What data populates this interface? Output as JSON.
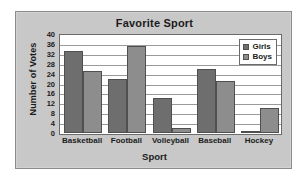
{
  "chart_data": {
    "type": "bar",
    "title": "Favorite Sport",
    "xlabel": "Sport",
    "ylabel": "Number of Votes",
    "categories": [
      "Basketball",
      "Football",
      "Volleyball",
      "Baseball",
      "Hockey"
    ],
    "series": [
      {
        "name": "Girls",
        "color": "#6e6e6e",
        "values": [
          33,
          22,
          14,
          26,
          1
        ]
      },
      {
        "name": "Boys",
        "color": "#8d8d8d",
        "values": [
          25,
          35,
          2,
          21,
          10
        ]
      }
    ],
    "ylim": [
      0,
      40
    ],
    "yticks": [
      0,
      4,
      8,
      12,
      16,
      20,
      24,
      28,
      32,
      36,
      40
    ],
    "grid": true,
    "legend_position": "top-right",
    "plot_background": "#ffffff",
    "figure_background": "#c8c8c8"
  }
}
